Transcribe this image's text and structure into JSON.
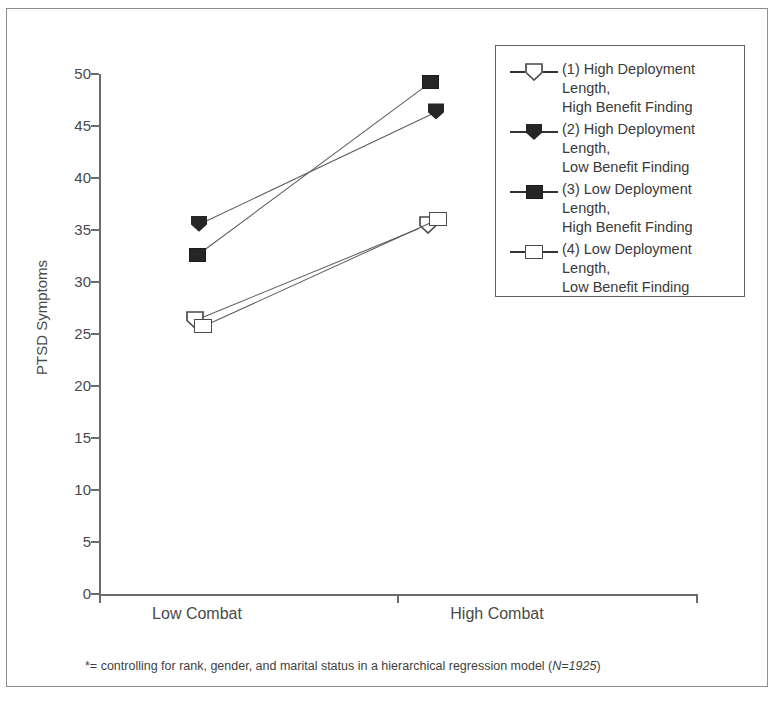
{
  "figure": {
    "y_axis_title": "PTSD Symptoms",
    "footnote_prefix": "*= controlling for rank, gender, and marital status in a hierarchical regression model (",
    "footnote_n": "N=1925",
    "footnote_suffix": ")"
  },
  "legend": {
    "items": [
      {
        "label": "(1) High Deployment Length,\nHigh Benefit Finding",
        "marker": "pentagon-open-icon"
      },
      {
        "label": "(2) High Deployment Length,\nLow Benefit Finding",
        "marker": "pentagon-filled-icon"
      },
      {
        "label": "(3) Low Deployment Length,\nHigh Benefit Finding",
        "marker": "square-filled-icon"
      },
      {
        "label": "(4) Low Deployment Length,\nLow Benefit Finding",
        "marker": "square-open-icon"
      }
    ]
  },
  "chart_data": {
    "type": "line",
    "title": "",
    "xlabel": "",
    "ylabel": "PTSD Symptoms",
    "categories": [
      "Low Combat",
      "High Combat"
    ],
    "ylim": [
      0,
      50
    ],
    "yticks": [
      0,
      5,
      10,
      15,
      20,
      25,
      30,
      35,
      40,
      45,
      50
    ],
    "grid": false,
    "legend_position": "top-right",
    "series": [
      {
        "name": "(1) High Deployment Length, High Benefit Finding",
        "marker": "pentagon-open",
        "values": [
          26.3,
          35.5
        ]
      },
      {
        "name": "(2) High Deployment Length, Low Benefit Finding",
        "marker": "pentagon-filled",
        "values": [
          35.6,
          46.4
        ]
      },
      {
        "name": "(3) Low Deployment Length, High Benefit Finding",
        "marker": "square-filled",
        "values": [
          32.6,
          49.2
        ]
      },
      {
        "name": "(4) Low Deployment Length, Low Benefit Finding",
        "marker": "square-open",
        "values": [
          25.8,
          36.1
        ]
      }
    ],
    "annotation": "*= controlling for rank, gender, and marital status in a hierarchical regression model (N=1925)"
  }
}
